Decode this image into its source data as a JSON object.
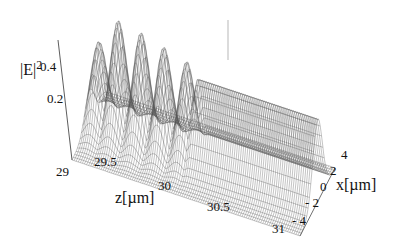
{
  "chart_data": {
    "type": "surface3d-wireframe",
    "title": "",
    "zlabel": "|E|^2",
    "xlabel": "z[µm]",
    "ylabel": "x[µm]",
    "z_axis_ticks": [
      "0.2",
      "0.4"
    ],
    "z_tick_values": [
      0.2,
      0.4
    ],
    "zaxis_label_text": "|E|",
    "zaxis_label_sup": "2",
    "z_range": [
      29,
      31
    ],
    "z_ticks": [
      "29",
      "29.5",
      "30",
      "30.5",
      "31"
    ],
    "x_range": [
      -4,
      4
    ],
    "x_ticks": [
      "4",
      "2",
      "0",
      "- 2",
      "- 4"
    ],
    "grid": false,
    "legend": null,
    "peaks": [
      {
        "z": 29.08,
        "height": 0.38
      },
      {
        "z": 29.25,
        "height": 0.5
      },
      {
        "z": 29.45,
        "height": 0.48
      },
      {
        "z": 29.65,
        "height": 0.45
      },
      {
        "z": 29.85,
        "height": 0.42
      }
    ],
    "plateau": {
      "z_start": 29.95,
      "z_end": 31,
      "height": 0.36
    }
  },
  "labels": {
    "zaxis_main": "|E|",
    "zaxis_sup": "2",
    "tick_04": "0.4",
    "tick_02": "0.2",
    "z29": "29",
    "z295": "29.5",
    "z30": "30",
    "z305": "30.5",
    "z31": "31",
    "zlabel": "z[µm]",
    "x4": "4",
    "x2": "2",
    "x0": "0",
    "xm2": "- 2",
    "xm4": "- 4",
    "xlabel": "x[µm]"
  }
}
